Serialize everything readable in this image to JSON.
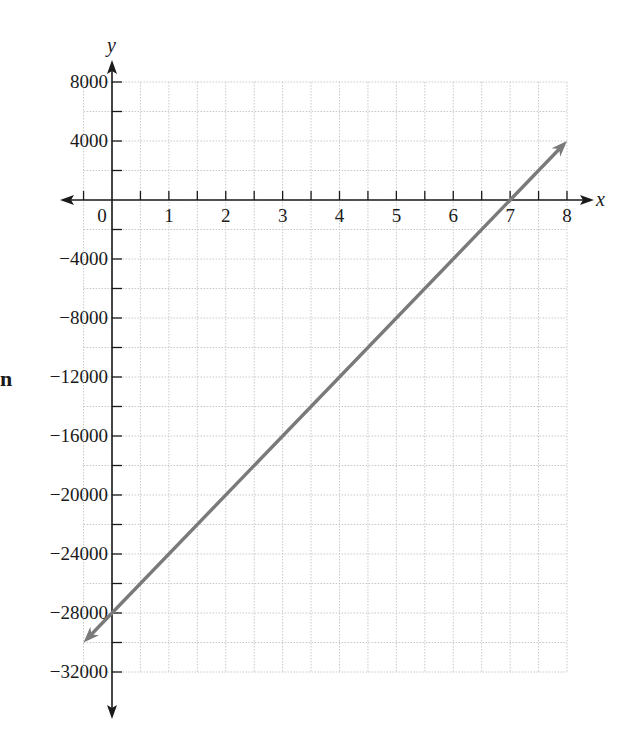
{
  "margin_text": "n",
  "chart_data": {
    "type": "line",
    "title": "",
    "xlabel": "x",
    "ylabel": "y",
    "xlim": [
      -0.5,
      8
    ],
    "ylim": [
      -32000,
      8000
    ],
    "x_ticks": [
      0,
      1,
      2,
      3,
      4,
      5,
      6,
      7,
      8
    ],
    "x_tick_labels": [
      "0",
      "1",
      "2",
      "3",
      "4",
      "5",
      "6",
      "7",
      "8"
    ],
    "y_ticks": [
      8000,
      4000,
      -4000,
      -8000,
      -12000,
      -16000,
      -20000,
      -24000,
      -28000,
      -32000
    ],
    "y_tick_labels": [
      "8000",
      "4000",
      "−4000",
      "−8000",
      "−12000",
      "−16000",
      "−20000",
      "−24000",
      "−28000",
      "−32000"
    ],
    "x_minor_step": 0.5,
    "y_minor_step": 2000,
    "grid": true,
    "legend": null,
    "series": [
      {
        "name": "y = 4000x − 28000",
        "color": "#7a7a7a",
        "x": [
          -0.5,
          0,
          7,
          8
        ],
        "y": [
          -30000,
          -28000,
          0,
          4000
        ],
        "arrows_both_ends": true
      }
    ]
  },
  "colors": {
    "axis": "#1a1a1a",
    "grid": "#c8c8c8",
    "line": "#7a7a7a",
    "background": "#ffffff"
  }
}
